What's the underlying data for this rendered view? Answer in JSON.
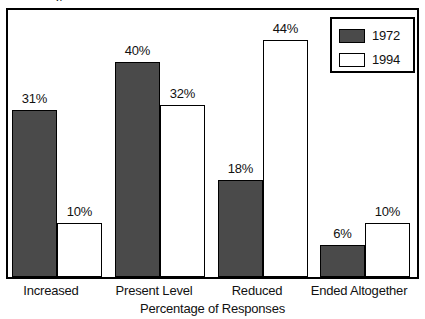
{
  "chart_data": {
    "type": "bar",
    "title": "",
    "xlabel": "Percentage of Responses",
    "ylabel": "",
    "ylim": [
      0,
      50
    ],
    "grid": false,
    "legend_position": "top-right",
    "categories": [
      "Increased",
      "Present Level",
      "Reduced",
      "Ended Altogether"
    ],
    "series": [
      {
        "name": "1972",
        "color": "#4a4a4a",
        "values": [
          31,
          40,
          18,
          6
        ],
        "labels": [
          "31%",
          "40%",
          "18%",
          "6%"
        ]
      },
      {
        "name": "1994",
        "color": "#ffffff",
        "values": [
          10,
          32,
          44,
          10
        ],
        "labels": [
          "10%",
          "32%",
          "44%",
          "10%"
        ]
      }
    ]
  },
  "legend": {
    "entries": [
      {
        "label": "1972",
        "swatch": "#4a4a4a"
      },
      {
        "label": "1994",
        "swatch": "#ffffff"
      }
    ]
  },
  "axis": {
    "x_title": "Percentage of Responses"
  },
  "fragment": {
    "top_clipped_text": "p"
  },
  "colors": {
    "series_1972": "#4a4a4a",
    "series_1994": "#ffffff",
    "outline": "#000000",
    "background": "#ffffff",
    "text": "#111111"
  }
}
